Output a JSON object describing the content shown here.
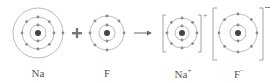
{
  "colors": {
    "shell": "#a8a8a8",
    "electron": "#8a8a8a",
    "nucleus": "#444444",
    "plus": "#777777",
    "arrow": "#666666",
    "bracket": "#9a9a9a",
    "text": "#555555"
  },
  "operators": {
    "plus": "+",
    "arrow": "→"
  },
  "species": [
    {
      "id": "na",
      "label": "Na",
      "charge": "",
      "shells": [
        2,
        8,
        1
      ],
      "bracketed": false
    },
    {
      "id": "f",
      "label": "F",
      "charge": "",
      "shells": [
        2,
        7
      ],
      "bracketed": false
    },
    {
      "id": "na-ion",
      "label": "Na",
      "charge": "+",
      "shells": [
        2,
        8
      ],
      "bracketed": true
    },
    {
      "id": "f-ion",
      "label": "F",
      "charge": "−",
      "shells": [
        2,
        8
      ],
      "bracketed": true
    }
  ]
}
